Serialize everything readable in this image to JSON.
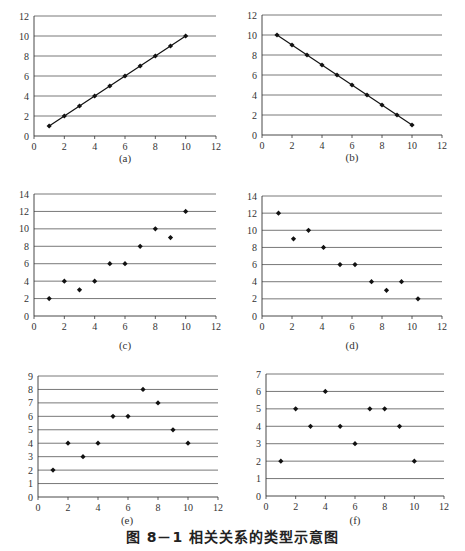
{
  "figure_caption": "图 8－1   相关关系的类型示意图",
  "chart_data": [
    {
      "id": "a",
      "label": "(a)",
      "type": "line",
      "markers": true,
      "x": [
        1,
        2,
        3,
        4,
        5,
        6,
        7,
        8,
        9,
        10
      ],
      "y": [
        1,
        2,
        3,
        4,
        5,
        6,
        7,
        8,
        9,
        10
      ],
      "xlim": [
        0,
        12
      ],
      "ylim": [
        0,
        12
      ],
      "xticks": [
        0,
        2,
        4,
        6,
        8,
        10,
        12
      ],
      "yticks": [
        0,
        2,
        4,
        6,
        8,
        10,
        12
      ],
      "grid": "horizontal",
      "title": "",
      "xlabel": "",
      "ylabel": ""
    },
    {
      "id": "b",
      "label": "(b)",
      "type": "line",
      "markers": true,
      "x": [
        1,
        2,
        3,
        4,
        5,
        6,
        7,
        8,
        9,
        10
      ],
      "y": [
        10,
        9,
        8,
        7,
        6,
        5,
        4,
        3,
        2,
        1
      ],
      "xlim": [
        0,
        12
      ],
      "ylim": [
        0,
        12
      ],
      "xticks": [
        0,
        2,
        4,
        6,
        8,
        10,
        12
      ],
      "yticks": [
        0,
        2,
        4,
        6,
        8,
        10,
        12
      ],
      "grid": "horizontal",
      "title": "",
      "xlabel": "",
      "ylabel": ""
    },
    {
      "id": "c",
      "label": "(c)",
      "type": "scatter",
      "x": [
        1,
        2,
        3,
        4,
        5,
        6,
        7,
        8,
        9,
        10
      ],
      "y": [
        2,
        4,
        3,
        4,
        6,
        6,
        8,
        10,
        9,
        12
      ],
      "xlim": [
        0,
        12
      ],
      "ylim": [
        0,
        14
      ],
      "xticks": [
        0,
        2,
        4,
        6,
        8,
        10,
        12
      ],
      "yticks": [
        0,
        2,
        4,
        6,
        8,
        10,
        12,
        14
      ],
      "grid": "horizontal",
      "title": "",
      "xlabel": "",
      "ylabel": ""
    },
    {
      "id": "d",
      "label": "(d)",
      "type": "scatter",
      "x": [
        1.1,
        2.1,
        3.1,
        4.1,
        5.2,
        6.2,
        7.3,
        8.3,
        9.3,
        10.4
      ],
      "y": [
        12,
        9,
        10,
        8,
        6,
        6,
        4,
        3,
        4,
        2
      ],
      "xlim": [
        0,
        12
      ],
      "ylim": [
        0,
        14
      ],
      "xticks": [
        0,
        2,
        4,
        6,
        8,
        10,
        12
      ],
      "yticks": [
        0,
        2,
        4,
        6,
        8,
        10,
        12,
        14
      ],
      "grid": "horizontal",
      "title": "",
      "xlabel": "",
      "ylabel": ""
    },
    {
      "id": "e",
      "label": "(e)",
      "type": "scatter",
      "x": [
        1,
        2,
        3,
        4,
        5,
        6,
        7,
        8,
        9,
        10
      ],
      "y": [
        2,
        4,
        3,
        4,
        6,
        6,
        8,
        7,
        5,
        4
      ],
      "xlim": [
        0,
        12
      ],
      "ylim": [
        0,
        9
      ],
      "xticks": [
        0,
        2,
        4,
        6,
        8,
        10,
        12
      ],
      "yticks": [
        0,
        1,
        2,
        3,
        4,
        5,
        6,
        7,
        8,
        9
      ],
      "grid": "horizontal",
      "title": "",
      "xlabel": "",
      "ylabel": ""
    },
    {
      "id": "f",
      "label": "(f)",
      "type": "scatter",
      "x": [
        1,
        2,
        3,
        4,
        5,
        6,
        7,
        8,
        9,
        10
      ],
      "y": [
        2,
        5,
        4,
        6,
        4,
        3,
        5,
        5,
        4,
        2
      ],
      "xlim": [
        0,
        12
      ],
      "ylim": [
        0,
        7
      ],
      "xticks": [
        0,
        2,
        4,
        6,
        8,
        10,
        12
      ],
      "yticks": [
        0,
        1,
        2,
        3,
        4,
        5,
        6,
        7
      ],
      "grid": "horizontal",
      "title": "",
      "xlabel": "",
      "ylabel": ""
    }
  ],
  "panels": {
    "a": {
      "label": "(a)"
    },
    "b": {
      "label": "(b)"
    },
    "c": {
      "label": "(c)"
    },
    "d": {
      "label": "(d)"
    },
    "e": {
      "label": "(e)"
    },
    "f": {
      "label": "(f)"
    }
  },
  "colors": {
    "gridline": "#555555",
    "axis": "#333333",
    "marker": "#111111",
    "line": "#111111"
  }
}
